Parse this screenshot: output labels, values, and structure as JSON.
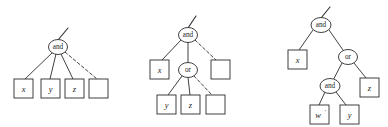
{
  "figure": {
    "kind": "and-or-tree-diagram",
    "background_color": "#ffffff",
    "stroke_color": "#2b2b2b",
    "text_color": "#1a1a1a"
  },
  "trees": [
    {
      "id": "tree-1",
      "root": {
        "label": "and",
        "cx": 58,
        "cy": 47,
        "rx": 9.5,
        "ry": 7.5
      },
      "root_stub": {
        "x1": 58,
        "y1": 40,
        "x2": 68,
        "y2": 28
      },
      "leaves": [
        {
          "label": "x",
          "prime": "",
          "x": 14,
          "y": 79,
          "w": 19,
          "h": 19,
          "edge": "solid"
        },
        {
          "label": "y",
          "prime": "",
          "x": 41,
          "y": 79,
          "w": 19,
          "h": 19,
          "edge": "solid"
        },
        {
          "label": "z",
          "prime": "",
          "x": 65,
          "y": 79,
          "w": 19,
          "h": 19,
          "edge": "solid"
        },
        {
          "label": "",
          "prime": "",
          "x": 89,
          "y": 79,
          "w": 19,
          "h": 19,
          "edge": "dashed"
        }
      ]
    },
    {
      "id": "tree-2",
      "root": {
        "label": "and",
        "cx": 188,
        "cy": 35,
        "rx": 9.5,
        "ry": 7.5
      },
      "root_stub": {
        "x1": 188,
        "y1": 28,
        "x2": 196,
        "y2": 16
      },
      "or_node": {
        "label": "or",
        "cx": 188,
        "cy": 70,
        "rx": 9.5,
        "ry": 7.5
      },
      "leaf_x": {
        "label": "x",
        "prime": "",
        "x": 150,
        "y": 60,
        "w": 19,
        "h": 19,
        "edge": "solid"
      },
      "leaf_empty_top": {
        "label": "",
        "prime": "",
        "x": 211,
        "y": 60,
        "w": 19,
        "h": 19,
        "edge": "dashed"
      },
      "or_leaves": [
        {
          "label": "y",
          "prime": "",
          "x": 157,
          "y": 95,
          "w": 19,
          "h": 19,
          "edge": "solid"
        },
        {
          "label": "z",
          "prime": "",
          "x": 181,
          "y": 95,
          "w": 19,
          "h": 19,
          "edge": "solid"
        },
        {
          "label": "",
          "prime": "",
          "x": 206,
          "y": 95,
          "w": 19,
          "h": 19,
          "edge": "dashed"
        }
      ]
    },
    {
      "id": "tree-3",
      "root": {
        "label": "and",
        "cx": 321,
        "cy": 25,
        "rx": 10,
        "ry": 7.5
      },
      "root_stub": {
        "x1": 321,
        "y1": 18,
        "x2": 330,
        "y2": 7
      },
      "leaf_x": {
        "label": "x",
        "prime": "",
        "x": 288,
        "y": 50,
        "w": 19,
        "h": 19,
        "edge": "solid"
      },
      "or_node": {
        "label": "or",
        "cx": 348,
        "cy": 57,
        "rx": 9.5,
        "ry": 7.5
      },
      "inner_and": {
        "label": "and",
        "cx": 330,
        "cy": 86,
        "rx": 10,
        "ry": 7.5
      },
      "leaf_z": {
        "label": "z",
        "prime": "",
        "x": 360,
        "y": 78,
        "w": 19,
        "h": 19,
        "edge": "solid"
      },
      "inner_leaves": [
        {
          "label": "w",
          "prime": "'",
          "x": 310,
          "y": 105,
          "w": 19,
          "h": 19,
          "edge": "solid"
        },
        {
          "label": "y",
          "prime": "",
          "x": 340,
          "y": 105,
          "w": 19,
          "h": 19,
          "edge": "solid"
        }
      ]
    }
  ],
  "labels": {
    "and": "and",
    "or": "or",
    "x": "x",
    "y": "y",
    "z": "z",
    "w": "w",
    "prime": "'",
    "empty": ""
  }
}
